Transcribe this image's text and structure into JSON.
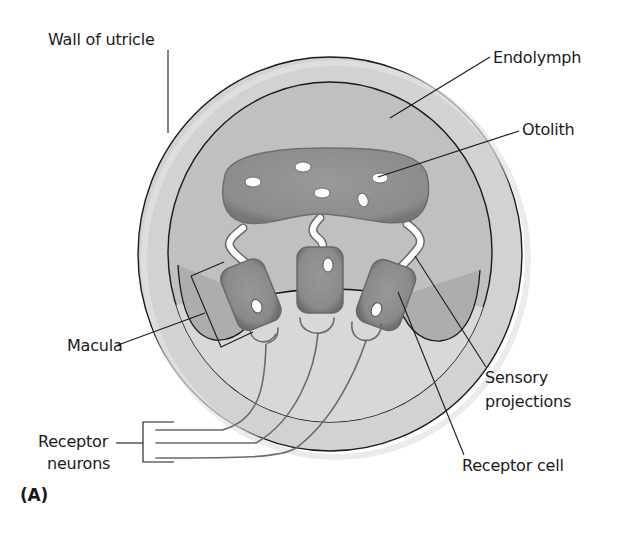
{
  "figure": {
    "panel_label": "(A)",
    "colors": {
      "wall": "#d2d2d2",
      "endolymph": "#c0c0c0",
      "macula_region": "#aeaeae",
      "lower_fluid": "#dadada",
      "otolith_membrane": "#8e8e8e",
      "receptor_cell": "#8a8a8a",
      "otolith_crystal": "#ffffff",
      "outline": "#1a1a1a",
      "neuron": "#6a6a6a"
    }
  },
  "labels": {
    "wall_of_utricle": "Wall of utricle",
    "endolymph": "Endolymph",
    "otolith": "Otolith",
    "macula": "Macula",
    "receptor_neurons_line1": "Receptor",
    "receptor_neurons_line2": "neurons",
    "sensory_projections_line1": "Sensory",
    "sensory_projections_line2": "projections",
    "receptor_cell": "Receptor cell"
  }
}
